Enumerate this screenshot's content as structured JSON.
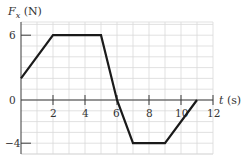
{
  "chart_data": {
    "type": "line",
    "title": "",
    "xlabel": "t (s)",
    "ylabel": "Fx (N)",
    "ylabel_parts": {
      "symbol": "F",
      "subscript": "x",
      "unit": "(N)"
    },
    "xlabel_parts": {
      "symbol": "t",
      "unit": "(s)"
    },
    "x": [
      0,
      2,
      5,
      6,
      7,
      9,
      11
    ],
    "series": [
      {
        "name": "Fx",
        "values": [
          2,
          6,
          6,
          0,
          -4,
          -4,
          0
        ],
        "color": "#1a1a1a"
      }
    ],
    "xlim": [
      0,
      12
    ],
    "ylim": [
      -5,
      7.2
    ],
    "x_ticks": [
      2,
      4,
      6,
      8,
      10,
      12
    ],
    "x_tick_labels": [
      "2",
      "4",
      "6",
      "8",
      "10",
      "12"
    ],
    "y_ticks": [
      6,
      0,
      -4
    ],
    "y_tick_labels": [
      "6",
      "0",
      "−4"
    ],
    "grid": true,
    "grid_step_x": 1,
    "grid_step_y": 1,
    "legend": "none"
  },
  "labels": {
    "y_symbol": "F",
    "y_sub": "x",
    "y_unit": " (N)",
    "x_symbol": "t",
    "x_unit": " (s)",
    "ytick_6": "6",
    "ytick_0": "0",
    "ytick_neg4": "−4",
    "xtick_2": "2",
    "xtick_4": "4",
    "xtick_6": "6",
    "xtick_8": "8",
    "xtick_10": "10",
    "xtick_12": "12"
  }
}
